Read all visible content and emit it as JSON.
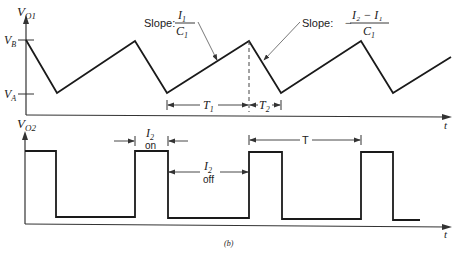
{
  "figure": {
    "caption": "(b)",
    "top_plot": {
      "y_label": "V",
      "y_label_sub": "O1",
      "x_label": "t",
      "level_high": "V",
      "level_high_sub": "B",
      "level_low": "V",
      "level_low_sub": "A",
      "slope1_prefix": "Slope:",
      "slope1_num": "I",
      "slope1_num_sub": "1",
      "slope1_den": "C",
      "slope1_den_sub": "1",
      "slope2_prefix": "Slope:",
      "slope2_sign": "−",
      "slope2_num": "I₂ − I₁",
      "slope2_den": "C",
      "slope2_den_sub": "1",
      "interval1": "T",
      "interval1_sub": "1",
      "interval2": "T",
      "interval2_sub": "2"
    },
    "bottom_plot": {
      "y_label": "V",
      "y_label_sub": "O2",
      "x_label": "t",
      "on_label_top": "I",
      "on_label_sub": "2",
      "on_label_bottom": "on",
      "off_label_top": "I",
      "off_label_sub": "2",
      "off_label_bottom": "off",
      "period_label": "T"
    }
  }
}
